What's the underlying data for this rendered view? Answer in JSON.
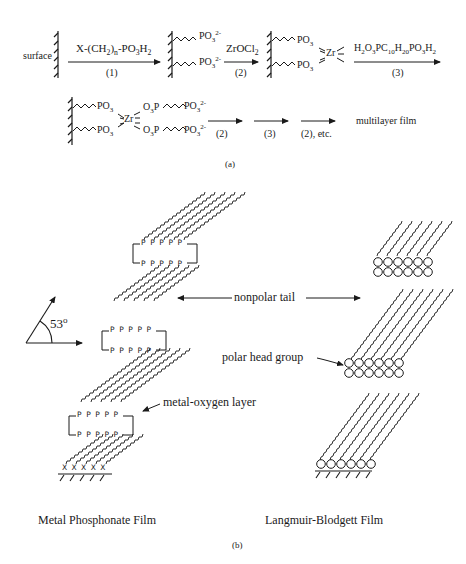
{
  "scheme": {
    "surface_label": "surface",
    "steps": [
      {
        "reagent_html": "X-(CH<sub>2</sub>)<sub>n</sub>-PO<sub>3</sub>H<sub>2</sub>",
        "reagent": "X-(CH2)n-PO3H2",
        "number": "(1)"
      },
      {
        "reagent_html": "ZrOCl<sub>2</sub>",
        "reagent": "ZrOCl2",
        "number": "(2)"
      },
      {
        "reagent_html": "H<sub>2</sub>O<sub>3</sub>PC<sub>10</sub>H<sub>20</sub>PO<sub>3</sub>H<sub>2</sub>",
        "reagent": "H2O3PC10H20PO3H2",
        "number": "(3)"
      }
    ],
    "intermediate1": {
      "group_html": "PO<sub>3</sub><sup>2-</sup>",
      "group": "PO3 2-"
    },
    "intermediate2": {
      "group_html": "PO<sub>3</sub>",
      "group": "PO3",
      "metal": "Zr"
    },
    "intermediate3": {
      "left_group_html": "PO<sub>3</sub>",
      "metal": "Zr",
      "right_link_html": "O<sub>3</sub>P",
      "right_end_html": "PO<sub>3</sub><sup>2-</sup>"
    },
    "repeat_steps": [
      "(2)",
      "(3)",
      "(2), etc."
    ],
    "product": "multilayer film",
    "panel_label": "(a)"
  },
  "films": {
    "angle_label": "53",
    "angle_unit": "o",
    "annotations": {
      "nonpolar_tail": "nonpolar tail",
      "polar_head_group": "polar head group",
      "metal_oxygen_layer": "metal-oxygen layer"
    },
    "phosphorus_label": "P",
    "anchor_label": "X",
    "left_title": "Metal Phosphonate Film",
    "right_title": "Langmuir-Blodgett Film",
    "panel_label": "(b)"
  }
}
